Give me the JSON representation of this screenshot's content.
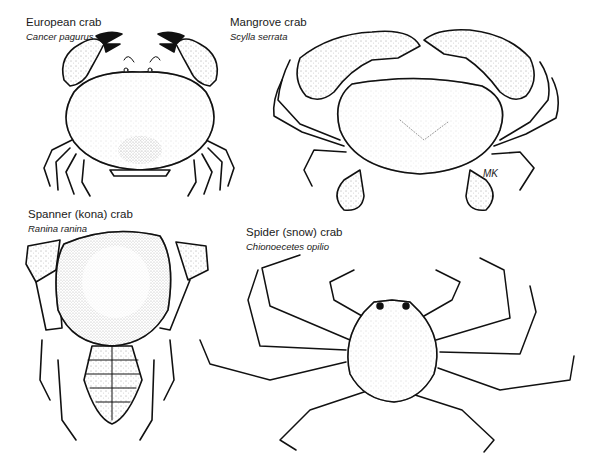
{
  "figure": {
    "specimens": [
      {
        "id": "european",
        "common_name": "European crab",
        "scientific_name": "Cancer pagurus"
      },
      {
        "id": "mangrove",
        "common_name": "Mangrove crab",
        "scientific_name": "Scylla serrata"
      },
      {
        "id": "spanner",
        "common_name": "Spanner (kona) crab",
        "scientific_name": "Ranina ranina"
      },
      {
        "id": "spider",
        "common_name": "Spider (snow) crab",
        "scientific_name": "Chionoecetes opilio"
      }
    ],
    "artist_signature": "MK"
  },
  "colors": {
    "ink": "#111111",
    "paper": "#ffffff",
    "stipple": "#555555"
  }
}
